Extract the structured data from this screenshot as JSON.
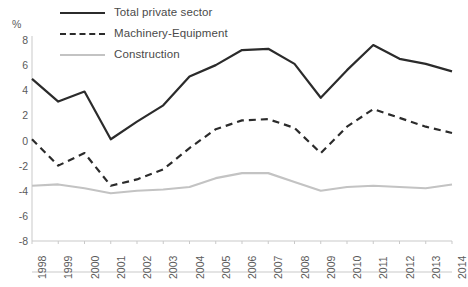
{
  "legend": {
    "items": [
      {
        "label": "Total private sector",
        "style": "solid",
        "color": "#2b2b2b"
      },
      {
        "label": "Machinery-Equipment",
        "style": "dashed",
        "color": "#2b2b2b"
      },
      {
        "label": "Construction",
        "style": "solid-light",
        "color": "#c3c3c3"
      }
    ]
  },
  "axes": {
    "unit": "%",
    "y_ticks": [
      "8",
      "6",
      "4",
      "2",
      "0",
      "-2",
      "-4",
      "-6",
      "-8"
    ],
    "x_ticks": [
      "1998",
      "1999",
      "2000",
      "2001",
      "2002",
      "2003",
      "2004",
      "2005",
      "2006",
      "2007",
      "2008",
      "2009",
      "2010",
      "2011",
      "2012",
      "2013",
      "2014"
    ]
  },
  "chart_data": {
    "type": "line",
    "title": "",
    "subtitle": "",
    "xlabel": "",
    "ylabel": "%",
    "ylim": [
      -8,
      8
    ],
    "ytick_step": 2,
    "grid": false,
    "legend_position": "top-left",
    "x": [
      1998,
      1999,
      2000,
      2001,
      2002,
      2003,
      2004,
      2005,
      2006,
      2007,
      2008,
      2009,
      2010,
      2011,
      2012,
      2013,
      2014
    ],
    "categories": [
      "1998",
      "1999",
      "2000",
      "2001",
      "2002",
      "2003",
      "2004",
      "2005",
      "2006",
      "2007",
      "2008",
      "2009",
      "2010",
      "2011",
      "2012",
      "2013",
      "2014"
    ],
    "series": [
      {
        "name": "Total private sector",
        "style": "solid",
        "color": "#2b2b2b",
        "values": [
          4.9,
          3.1,
          3.9,
          0.1,
          1.5,
          2.8,
          5.1,
          6.0,
          7.2,
          7.3,
          6.1,
          3.4,
          5.6,
          7.6,
          6.5,
          6.1,
          5.5
        ]
      },
      {
        "name": "Machinery-Equipment",
        "style": "dashed",
        "color": "#2b2b2b",
        "values": [
          0.1,
          -2.0,
          -1.0,
          -3.6,
          -3.1,
          -2.3,
          -0.6,
          0.9,
          1.6,
          1.7,
          1.0,
          -1.0,
          1.1,
          2.5,
          1.8,
          1.1,
          0.6
        ]
      },
      {
        "name": "Construction",
        "style": "solid-light",
        "color": "#c3c3c3",
        "values": [
          -3.6,
          -3.5,
          -3.8,
          -4.2,
          -4.0,
          -3.9,
          -3.7,
          -3.0,
          -2.6,
          -2.6,
          -3.3,
          -4.0,
          -3.7,
          -3.6,
          -3.7,
          -3.8,
          -3.5
        ]
      }
    ]
  }
}
